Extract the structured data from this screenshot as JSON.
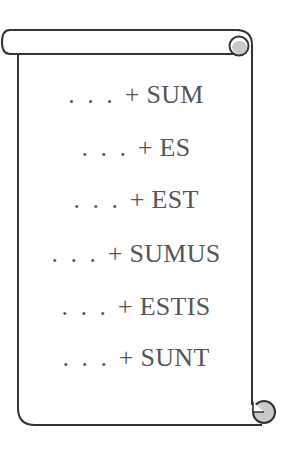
{
  "scroll": {
    "stroke_color": "#333333",
    "curl_fill_color": "#c8c8c8",
    "background_color": "#ffffff",
    "text_color": "#555555"
  },
  "lines": [
    {
      "prefix": ". . .",
      "operator": "+",
      "word": "SUM"
    },
    {
      "prefix": ". . .",
      "operator": "+",
      "word": "ES"
    },
    {
      "prefix": ". . .",
      "operator": "+",
      "word": "EST"
    },
    {
      "prefix": ". . .",
      "operator": "+",
      "word": "SUMUS"
    },
    {
      "prefix": ". . .",
      "operator": "+",
      "word": "ESTIS"
    },
    {
      "prefix": ". . .",
      "operator": "+",
      "word": "SUNT"
    }
  ]
}
